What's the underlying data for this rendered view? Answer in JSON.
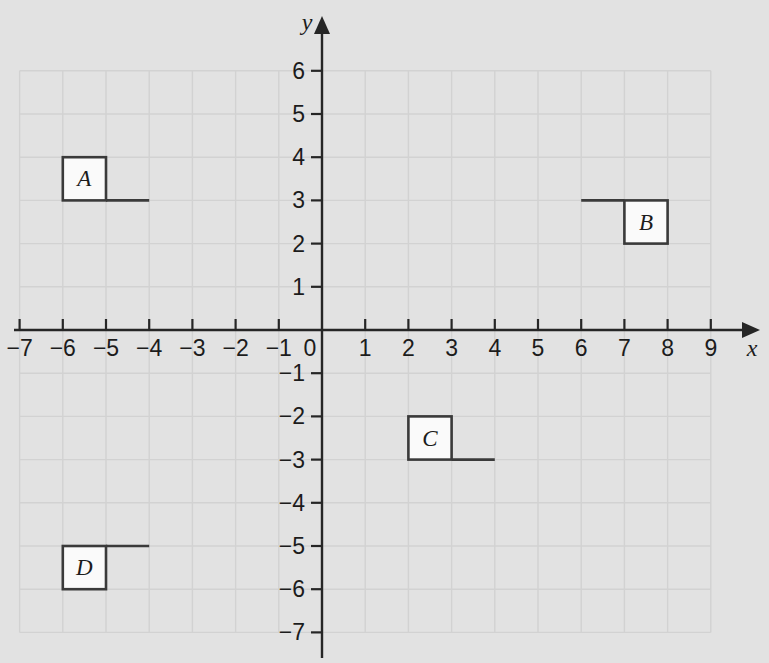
{
  "figure": {
    "kind": "coordinate-plane",
    "background_color": "#e2e2e2",
    "grid_color": "#d2d2d2",
    "axis_color": "#262626",
    "shape_stroke_color": "#3a3a3a",
    "shape_fill_color": "#fafafa"
  },
  "chart_data": {
    "type": "scatter",
    "title": "",
    "xlabel": "x",
    "ylabel": "y",
    "xlim": [
      -7,
      9
    ],
    "ylim": [
      -7,
      6
    ],
    "grid": true,
    "legend": "none",
    "x_ticks": [
      -7,
      -6,
      -5,
      -4,
      -3,
      -2,
      -1,
      1,
      2,
      3,
      4,
      5,
      6,
      7,
      8,
      9
    ],
    "x_tick_labels": [
      "−7",
      "−6",
      "−5",
      "−4",
      "−3",
      "−2",
      "−1",
      "1",
      "2",
      "3",
      "4",
      "5",
      "6",
      "7",
      "8",
      "9"
    ],
    "y_ticks": [
      6,
      5,
      4,
      3,
      2,
      1,
      -1,
      -2,
      -3,
      -4,
      -5,
      -6,
      -7
    ],
    "y_tick_labels": [
      "6",
      "5",
      "4",
      "3",
      "2",
      "1",
      "−1",
      "−2",
      "−3",
      "−4",
      "−5",
      "−6",
      "−7"
    ],
    "origin_label": "0",
    "shapes": [
      {
        "label": "A",
        "square": {
          "x0": -6,
          "y0": 3,
          "x1": -5,
          "y1": 4
        },
        "flag": {
          "from_x": -5,
          "to_x": -4,
          "y": 3
        },
        "label_at": {
          "x": -5.5,
          "y": 3.5
        }
      },
      {
        "label": "B",
        "square": {
          "x0": 7,
          "y0": 2,
          "x1": 8,
          "y1": 3
        },
        "flag": {
          "from_x": 7,
          "to_x": 6,
          "y": 3
        },
        "label_at": {
          "x": 7.5,
          "y": 2.5
        }
      },
      {
        "label": "C",
        "square": {
          "x0": 2,
          "y0": -3,
          "x1": 3,
          "y1": -2
        },
        "flag": {
          "from_x": 3,
          "to_x": 4,
          "y": -3
        },
        "label_at": {
          "x": 2.5,
          "y": -2.5
        }
      },
      {
        "label": "D",
        "square": {
          "x0": -6,
          "y0": -6,
          "x1": -5,
          "y1": -5
        },
        "flag": {
          "from_x": -5,
          "to_x": -4,
          "y": -5
        },
        "label_at": {
          "x": -5.5,
          "y": -5.5
        }
      }
    ]
  }
}
